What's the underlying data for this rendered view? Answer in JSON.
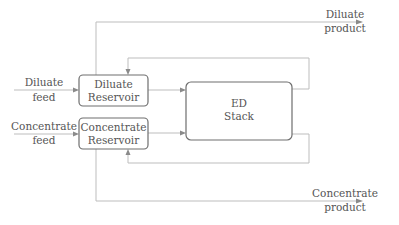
{
  "diagram": {
    "title": "",
    "colors": {
      "box_stroke": "#6e6e6e",
      "line": "#bdbdbd",
      "arrow": "#8a8a8a",
      "text": "#555555"
    },
    "nodes": [
      {
        "id": "diluate_reservoir",
        "line1": "Diluate",
        "line2": "Reservoir"
      },
      {
        "id": "concentrate_reservoir",
        "line1": "Concentrate",
        "line2": "Reservoir"
      },
      {
        "id": "ed_stack",
        "line1": "ED",
        "line2": "Stack"
      }
    ],
    "labels": {
      "diluate_feed": {
        "line1": "Diluate",
        "line2": "feed"
      },
      "concentrate_feed": {
        "line1": "Concentrate",
        "line2": "feed"
      },
      "diluate_product": {
        "line1": "Diluate",
        "line2": "product"
      },
      "concentrate_product": {
        "line1": "Concentrate",
        "line2": "product"
      }
    },
    "edges": [
      {
        "from": "diluate_feed",
        "to": "diluate_reservoir"
      },
      {
        "from": "concentrate_feed",
        "to": "concentrate_reservoir"
      },
      {
        "from": "diluate_reservoir",
        "to": "ed_stack"
      },
      {
        "from": "concentrate_reservoir",
        "to": "ed_stack"
      },
      {
        "from": "ed_stack",
        "to": "diluate_reservoir",
        "type": "recirculation"
      },
      {
        "from": "ed_stack",
        "to": "concentrate_reservoir",
        "type": "recirculation"
      },
      {
        "from": "diluate_reservoir",
        "to": "diluate_product"
      },
      {
        "from": "concentrate_reservoir",
        "to": "concentrate_product"
      }
    ]
  }
}
